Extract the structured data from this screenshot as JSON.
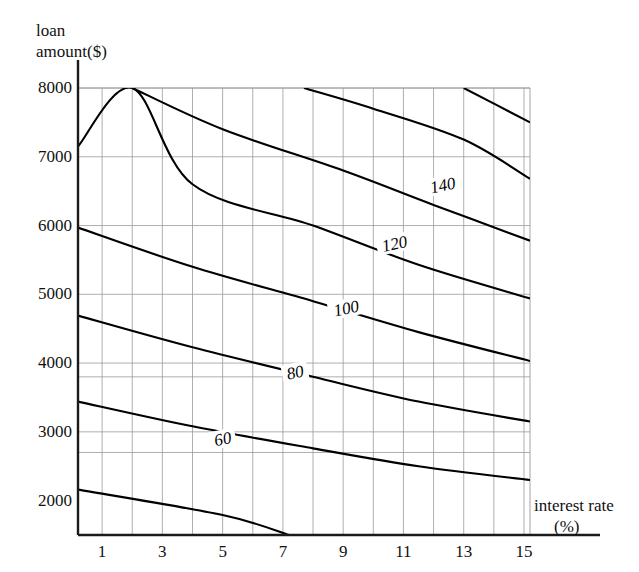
{
  "chart_data": {
    "type": "line",
    "title": "",
    "subtitle": "",
    "xlabel": "interest rate",
    "xlabel_unit": "(%)",
    "ylabel_line1": "loan",
    "ylabel_line2": "amount($)",
    "xlim": [
      0.2,
      15.2
    ],
    "ylim": [
      1500,
      8000
    ],
    "grid": true,
    "legend_position": "none",
    "xticks": [
      1,
      3,
      5,
      7,
      9,
      11,
      13,
      15
    ],
    "xtick_labels": [
      "1",
      "3",
      "5",
      "7",
      "9",
      "11",
      "13",
      "15"
    ],
    "yticks": [
      2000,
      3000,
      4000,
      5000,
      6000,
      7000,
      8000
    ],
    "ytick_labels": [
      "2000",
      "3000",
      "4000",
      "5000",
      "6000",
      "7000",
      "8000"
    ],
    "x_gridlines": [
      1,
      2,
      3,
      4,
      5,
      6,
      7,
      8,
      9,
      10,
      11,
      12,
      13,
      14,
      15
    ],
    "y_gridlines": [
      2700,
      3000,
      3800,
      4000,
      5000,
      6000,
      7000,
      8000
    ],
    "contour_levels": [
      20,
      40,
      60,
      80,
      100,
      120,
      140
    ],
    "series": [
      {
        "name": "20",
        "label": "",
        "label_x": null,
        "label_y": null,
        "points": [
          [
            0.2,
            2160
          ],
          [
            5.0,
            1790
          ],
          [
            7.2,
            1500
          ]
        ]
      },
      {
        "name": "40",
        "label": "60",
        "label_x": 5.0,
        "label_y": 2900,
        "points": [
          [
            0.2,
            3440
          ],
          [
            4.0,
            3080
          ],
          [
            8.0,
            2760
          ],
          [
            11.5,
            2500
          ],
          [
            15.2,
            2300
          ]
        ]
      },
      {
        "name": "60",
        "label": "80",
        "label_x": 7.4,
        "label_y": 3870,
        "points": [
          [
            0.2,
            4690
          ],
          [
            4.0,
            4230
          ],
          [
            8.0,
            3800
          ],
          [
            11.5,
            3440
          ],
          [
            15.2,
            3150
          ]
        ]
      },
      {
        "name": "80",
        "label": "100",
        "label_x": 9.1,
        "label_y": 4800,
        "points": [
          [
            0.2,
            5970
          ],
          [
            4.0,
            5400
          ],
          [
            8.0,
            4900
          ],
          [
            11.5,
            4450
          ],
          [
            15.2,
            4030
          ]
        ]
      },
      {
        "name": "100",
        "label": "120",
        "label_x": 10.7,
        "label_y": 5740,
        "points": [
          [
            0.2,
            7150
          ],
          [
            2.0,
            8000
          ],
          [
            4.0,
            6600
          ],
          [
            8.0,
            6000
          ],
          [
            11.5,
            5430
          ],
          [
            15.2,
            4940
          ]
        ]
      },
      {
        "name": "120",
        "label": "140",
        "label_x": 12.3,
        "label_y": 6590,
        "points": [
          [
            2.0,
            8000
          ],
          [
            5.0,
            7400
          ],
          [
            9.0,
            6800
          ],
          [
            12.0,
            6300
          ],
          [
            15.2,
            5780
          ]
        ]
      },
      {
        "name": "140",
        "label": "",
        "label_x": null,
        "label_y": null,
        "points": [
          [
            7.7,
            8000
          ],
          [
            10.0,
            7700
          ],
          [
            13.0,
            7250
          ],
          [
            15.2,
            6680
          ]
        ]
      },
      {
        "name": "160",
        "label": "",
        "label_x": null,
        "label_y": null,
        "points": [
          [
            13.0,
            8000
          ],
          [
            15.2,
            7500
          ]
        ]
      }
    ],
    "contour_label_texts": [
      "60",
      "80",
      "100",
      "120",
      "140"
    ],
    "axis_color": "#1a1a1a",
    "grid_color": "#9a9a9a",
    "contour_color": "#000000",
    "background_color": "#ffffff"
  }
}
